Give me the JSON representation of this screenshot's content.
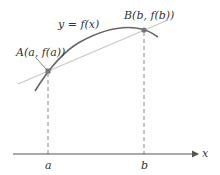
{
  "diagram": {
    "type": "secant-line-on-curve",
    "curve_label": "y = f(x)",
    "point_a_label": "A(a, f(a))",
    "point_b_label": "B(b, f(b))",
    "x_axis_label": "x",
    "tick_a_label": "a",
    "tick_b_label": "b"
  },
  "colors": {
    "curve": "#666666",
    "secant": "#c8c8c8",
    "axis": "#555555",
    "dashed": "#888888",
    "point": "#777777",
    "text": "#333333"
  }
}
